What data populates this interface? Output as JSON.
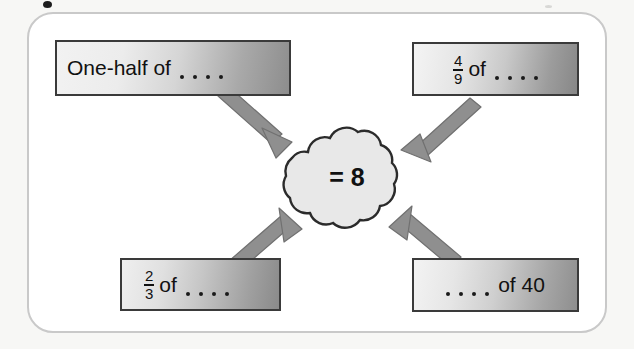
{
  "diagram": {
    "center": {
      "shape": "cloud",
      "label": "= 8"
    },
    "boxes": [
      {
        "id": "top-left",
        "text_prefix": "One-half of",
        "blank": "....",
        "text_suffix": "",
        "full_text": "One-half of ....",
        "fraction": null
      },
      {
        "id": "top-right",
        "text_prefix": "",
        "numerator": "4",
        "denominator": "9",
        "of_label": "of",
        "blank": "....",
        "full_text": "4/9 of ....",
        "fraction": "4/9"
      },
      {
        "id": "bottom-left",
        "text_prefix": "",
        "numerator": "2",
        "denominator": "3",
        "of_label": "of",
        "blank": "....",
        "full_text": "2/3 of ....",
        "fraction": "2/3"
      },
      {
        "id": "bottom-right",
        "blank": "....",
        "text_suffix": "of 40",
        "full_text": ".... of 40",
        "fraction": null
      }
    ],
    "arrows": [
      {
        "from": "top-left",
        "to": "center",
        "direction": "down-right"
      },
      {
        "from": "top-right",
        "to": "center",
        "direction": "down-left"
      },
      {
        "from": "bottom-left",
        "to": "center",
        "direction": "up-right"
      },
      {
        "from": "bottom-right",
        "to": "center",
        "direction": "up-left"
      }
    ]
  },
  "colors": {
    "arrow": "#8f8f8f",
    "arrow_outline": "#6f6f6f",
    "cloud_fill": "#e8e8e8",
    "cloud_stroke": "#2b2b2b",
    "box_border": "#3a3a3a",
    "panel_border": "#c9c9c9",
    "page_background": "#f7f7f5"
  }
}
